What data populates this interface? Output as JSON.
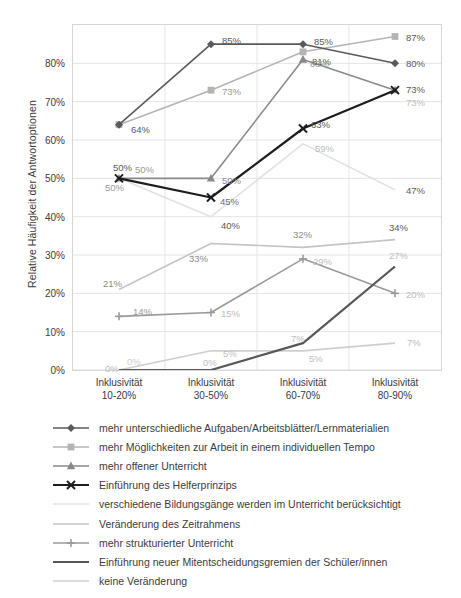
{
  "chart": {
    "type": "line",
    "y_axis_title": "Relative Häufigkeit der Antwortoptionen",
    "categories": [
      {
        "line1": "Inklusivität",
        "line2": "10-20%"
      },
      {
        "line1": "Inklusivität",
        "line2": "30-50%"
      },
      {
        "line1": "Inklusivität",
        "line2": "60-70%"
      },
      {
        "line1": "Inklusivität",
        "line2": "80-90%"
      }
    ],
    "y_ticks": [
      "0%",
      "10%",
      "20%",
      "30%",
      "40%",
      "50%",
      "60%",
      "70%",
      "80%"
    ],
    "ylim": [
      0,
      90
    ],
    "grid": true,
    "legend_position": "below"
  },
  "chart_data": {
    "type": "line",
    "title": "",
    "xlabel": "",
    "ylabel": "Relative Häufigkeit der Antwortoptionen",
    "ylim": [
      0,
      90
    ],
    "grid": true,
    "categories": [
      "Inklusivität 10-20%",
      "Inklusivität 30-50%",
      "Inklusivität 60-70%",
      "Inklusivität 80-90%"
    ],
    "series": [
      {
        "name": "mehr unterschiedliche Aufgaben/Arbeitsblätter/Lernmaterialien",
        "values": [
          64,
          85,
          85,
          80
        ],
        "labels": [
          "64%",
          "85%",
          "85%",
          "80%"
        ],
        "color": "#5a5a5a",
        "marker": "diamond"
      },
      {
        "name": "mehr Möglichkeiten zur Arbeit in einem individuellen Tempo",
        "values": [
          64,
          73,
          83,
          87
        ],
        "labels": [
          "64%",
          "73%",
          "83%",
          "87%"
        ],
        "color": "#b4b4b4",
        "marker": "square"
      },
      {
        "name": "mehr offener Unterricht",
        "values": [
          50,
          50,
          81,
          73
        ],
        "labels": [
          "50%",
          "50%",
          "81%",
          "73%"
        ],
        "color": "#8a8a8a",
        "marker": "triangle"
      },
      {
        "name": "Einführung des Helferprinzips",
        "values": [
          50,
          45,
          63,
          73
        ],
        "labels": [
          "50%",
          "45%",
          "63%",
          "73%"
        ],
        "color": "#1d1d1d",
        "marker": "x"
      },
      {
        "name": "verschiedene Bildungsgänge werden im Unterricht berücksichtigt",
        "values": [
          50,
          40,
          59,
          47
        ],
        "labels": [
          "50%",
          "40%",
          "59%",
          "47%"
        ],
        "color": "#e2e2e2",
        "marker": "none"
      },
      {
        "name": "Veränderung des Zeitrahmens",
        "values": [
          21,
          33,
          32,
          34
        ],
        "labels": [
          "21%",
          "33%",
          "32%",
          "34%"
        ],
        "color": "#c4c4c4",
        "marker": "none"
      },
      {
        "name": "mehr strukturierter Unterricht",
        "values": [
          14,
          15,
          29,
          20
        ],
        "labels": [
          "14%",
          "15%",
          "29%",
          "20%"
        ],
        "color": "#9a9a9a",
        "marker": "plus"
      },
      {
        "name": "Einführung neuer Mitentscheidungsgremien der Schüler/innen",
        "values": [
          0,
          0,
          7,
          27
        ],
        "labels": [
          "0%",
          "0%",
          "7%",
          "27%"
        ],
        "color": "#575757",
        "marker": "none"
      },
      {
        "name": "keine Veränderung",
        "values": [
          0,
          5,
          5,
          7
        ],
        "labels": [
          "0%",
          "5%",
          "5%",
          "7%"
        ],
        "color": "#cfcfcf",
        "marker": "none"
      }
    ],
    "point_labels": [
      {
        "text": "64%",
        "cat": 0,
        "value": 64,
        "dx": 12,
        "dy": 4,
        "color": "#5a5a5a"
      },
      {
        "text": "50%",
        "cat": 0,
        "value": 50,
        "dx": -6,
        "dy": -11,
        "color": "#5a5a5a"
      },
      {
        "text": "50%",
        "cat": 0,
        "value": 50,
        "dx": 16,
        "dy": -9,
        "color": "#9a9a9a"
      },
      {
        "text": "50%",
        "cat": 0,
        "value": 50,
        "dx": -14,
        "dy": 9,
        "color": "#9a9a9a"
      },
      {
        "text": "21%",
        "cat": 0,
        "value": 21,
        "dx": -16,
        "dy": -7,
        "color": "#8a8a8a"
      },
      {
        "text": "14%",
        "cat": 0,
        "value": 14,
        "dx": 14,
        "dy": -5,
        "color": "#9a9a9a"
      },
      {
        "text": "0%",
        "cat": 0,
        "value": 0,
        "dx": 8,
        "dy": -9,
        "color": "#cfcfcf"
      },
      {
        "text": "0%",
        "cat": 0,
        "value": 0,
        "dx": -14,
        "dy": -2,
        "color": "#bdbdbd"
      },
      {
        "text": "85%",
        "cat": 1,
        "value": 85,
        "dx": 11,
        "dy": -4,
        "color": "#5a5a5a"
      },
      {
        "text": "73%",
        "cat": 1,
        "value": 73,
        "dx": 11,
        "dy": 1,
        "color": "#9a9a9a"
      },
      {
        "text": "50%",
        "cat": 1,
        "value": 50,
        "dx": 11,
        "dy": 2,
        "color": "#8a8a8a"
      },
      {
        "text": "45%",
        "cat": 1,
        "value": 45,
        "dx": 9,
        "dy": 3,
        "color": "#6f6f6f"
      },
      {
        "text": "40%",
        "cat": 1,
        "value": 40,
        "dx": 10,
        "dy": 8,
        "color": "#5a5a5a"
      },
      {
        "text": "33%",
        "cat": 1,
        "value": 33,
        "dx": -22,
        "dy": 14,
        "color": "#8a8a8a"
      },
      {
        "text": "15%",
        "cat": 1,
        "value": 15,
        "dx": 10,
        "dy": 0,
        "color": "#bdbdbd"
      },
      {
        "text": "5%",
        "cat": 1,
        "value": 5,
        "dx": 12,
        "dy": 2,
        "color": "#bdbdbd"
      },
      {
        "text": "0%",
        "cat": 1,
        "value": 0,
        "dx": -8,
        "dy": -8,
        "color": "#bdbdbd"
      },
      {
        "text": "85%",
        "cat": 2,
        "value": 85,
        "dx": 11,
        "dy": -3,
        "color": "#5a5a5a"
      },
      {
        "text": "81%",
        "cat": 2,
        "value": 81,
        "dx": 9,
        "dy": 1,
        "color": "#5a5a5a"
      },
      {
        "text": "83%",
        "cat": 2,
        "value": 83,
        "dx": 7,
        "dy": 11,
        "color": "#9a9a9a"
      },
      {
        "text": "63%",
        "cat": 2,
        "value": 63,
        "dx": 8,
        "dy": -5,
        "color": "#5a5a5a"
      },
      {
        "text": "59%",
        "cat": 2,
        "value": 59,
        "dx": 12,
        "dy": 4,
        "color": "#bdbdbd"
      },
      {
        "text": "32%",
        "cat": 2,
        "value": 32,
        "dx": -10,
        "dy": -13,
        "color": "#8a8a8a"
      },
      {
        "text": "29%",
        "cat": 2,
        "value": 29,
        "dx": 10,
        "dy": 2,
        "color": "#bdbdbd"
      },
      {
        "text": "7%",
        "cat": 2,
        "value": 7,
        "dx": -12,
        "dy": -5,
        "color": "#bdbdbd"
      },
      {
        "text": "5%",
        "cat": 2,
        "value": 5,
        "dx": 6,
        "dy": 7,
        "color": "#bdbdbd"
      },
      {
        "text": "87%",
        "cat": 3,
        "value": 87,
        "dx": 11,
        "dy": 0,
        "color": "#5a5a5a"
      },
      {
        "text": "80%",
        "cat": 3,
        "value": 80,
        "dx": 11,
        "dy": 0,
        "color": "#5a5a5a"
      },
      {
        "text": "73%",
        "cat": 3,
        "value": 73,
        "dx": 11,
        "dy": -1,
        "color": "#5a5a5a"
      },
      {
        "text": "73%",
        "cat": 3,
        "value": 73,
        "dx": 11,
        "dy": 12,
        "color": "#bdbdbd"
      },
      {
        "text": "47%",
        "cat": 3,
        "value": 47,
        "dx": 11,
        "dy": 0,
        "color": "#5a5a5a"
      },
      {
        "text": "34%",
        "cat": 3,
        "value": 34,
        "dx": -6,
        "dy": -13,
        "color": "#5a5a5a"
      },
      {
        "text": "27%",
        "cat": 3,
        "value": 27,
        "dx": -6,
        "dy": -12,
        "color": "#bdbdbd"
      },
      {
        "text": "20%",
        "cat": 3,
        "value": 20,
        "dx": 11,
        "dy": 1,
        "color": "#bdbdbd"
      },
      {
        "text": "7%",
        "cat": 3,
        "value": 7,
        "dx": 12,
        "dy": -1,
        "color": "#bdbdbd"
      }
    ]
  },
  "legend": {
    "items": [
      {
        "label": "mehr unterschiedliche Aufgaben/Arbeitsblätter/Lernmaterialien",
        "color": "#5a5a5a",
        "marker": "diamond",
        "width": 1.6
      },
      {
        "label": "mehr Möglichkeiten zur Arbeit in einem individuellen Tempo",
        "color": "#b4b4b4",
        "marker": "square",
        "width": 1.6
      },
      {
        "label": "mehr offener Unterricht",
        "color": "#8a8a8a",
        "marker": "triangle",
        "width": 1.6
      },
      {
        "label": "Einführung des Helferprinzips",
        "color": "#1d1d1d",
        "marker": "x",
        "width": 1.8
      },
      {
        "label": "verschiedene Bildungsgänge werden im Unterricht berücksichtigt",
        "color": "#e2e2e2",
        "marker": "none",
        "width": 1.4
      },
      {
        "label": "Veränderung des Zeitrahmens",
        "color": "#c4c4c4",
        "marker": "none",
        "width": 1.4
      },
      {
        "label": "mehr strukturierter Unterricht",
        "color": "#9a9a9a",
        "marker": "plus",
        "width": 1.4
      },
      {
        "label": "Einführung neuer Mitentscheidungsgremien der Schüler/innen",
        "color": "#575757",
        "marker": "none",
        "width": 2.0
      },
      {
        "label": "keine Veränderung",
        "color": "#cfcfcf",
        "marker": "none",
        "width": 1.4
      }
    ]
  }
}
